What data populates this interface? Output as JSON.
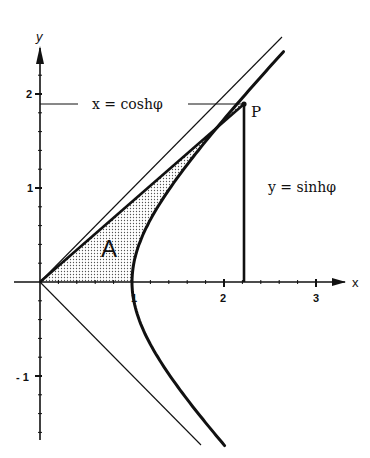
{
  "diagram": {
    "axes": {
      "x_label": "x",
      "y_label": "y",
      "x_ticks": [
        {
          "value": 1,
          "label": "1"
        },
        {
          "value": 2,
          "label": "2"
        },
        {
          "value": 3,
          "label": "3"
        }
      ],
      "y_ticks": [
        {
          "value": 2,
          "label": "2"
        },
        {
          "value": 1,
          "label": "1"
        },
        {
          "value": -1,
          "label": "- 1"
        }
      ]
    },
    "point": {
      "label": "P",
      "x": 2.2,
      "y": 1.9
    },
    "annotations": {
      "x_eq": "x = coshφ",
      "y_eq": "y = sinhφ",
      "area": "A"
    },
    "curves": {
      "hyperbola": "x² − y² = 1 (right branch)",
      "asymptotes": [
        "y = x",
        "y = −x"
      ]
    },
    "colors": {
      "ink": "#111111",
      "background": "#ffffff",
      "stipple": "#555555"
    }
  }
}
